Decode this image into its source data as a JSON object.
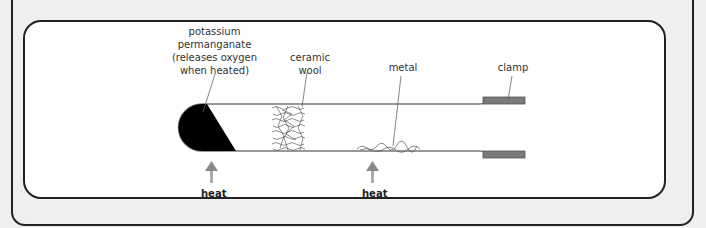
{
  "diagram": {
    "labels": {
      "potassium_permanganate": [
        "potassium",
        "permanganate",
        "(releases oxygen",
        "when heated)"
      ],
      "ceramic_wool": [
        "ceramic",
        "wool"
      ],
      "metal": "metal",
      "clamp": "clamp"
    },
    "heat_labels": [
      "heat",
      "heat"
    ],
    "colors": {
      "frame": "#222222",
      "background": "#efefef",
      "panel": "#ffffff",
      "clamp": "#7a7a7a",
      "arrow": "#999999"
    }
  }
}
